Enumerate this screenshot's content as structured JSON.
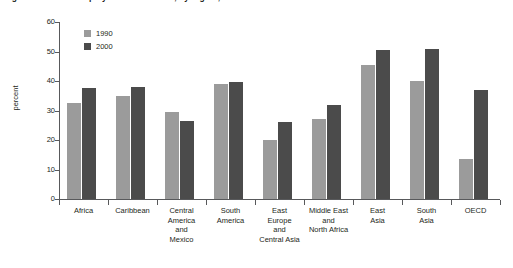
{
  "caption": {
    "text": "Figure 1  Share of employment in services, by region, 1990 and 2000"
  },
  "colors": {
    "series_1990": "#9b9b9b",
    "series_2000": "#4b4b4b",
    "axis": "#58595b",
    "text": "#231f20",
    "background": "#ffffff"
  },
  "legend": {
    "position": "top-left",
    "entries": [
      {
        "label": "1990",
        "color": "#9b9b9b"
      },
      {
        "label": "2000",
        "color": "#4b4b4b"
      }
    ]
  },
  "axes": {
    "ylabel": "percent",
    "yticks": [
      "0",
      "10",
      "20",
      "30",
      "40",
      "50",
      "60"
    ],
    "ymin": 0,
    "ymax": 60,
    "ystep": 10
  },
  "chart_data": {
    "type": "bar",
    "title": "Figure 1  Share of employment in services, by region, 1990 and 2000",
    "xlabel": "",
    "ylabel": "percent",
    "ylim": [
      0,
      60
    ],
    "ytick_values": [
      0,
      10,
      20,
      30,
      40,
      50,
      60
    ],
    "grid": false,
    "legend_position": "top-left",
    "categories": [
      "Africa",
      "Caribbean",
      "Central\nAmerica\nand\nMexico",
      "South\nAmerica",
      "East\nEurope\nand\nCentral Asia",
      "Middle East\nand\nNorth Africa",
      "East\nAsia",
      "South\nAsia",
      "OECD"
    ],
    "series": [
      {
        "name": "1990",
        "color": "#9b9b9b",
        "values": [
          32.5,
          35.0,
          29.5,
          39.0,
          20.0,
          27.0,
          45.5,
          40.0,
          13.5
        ]
      },
      {
        "name": "2000",
        "color": "#4b4b4b",
        "values": [
          37.5,
          38.0,
          26.5,
          39.5,
          26.0,
          32.0,
          50.5,
          51.0,
          37.0
        ]
      }
    ]
  }
}
